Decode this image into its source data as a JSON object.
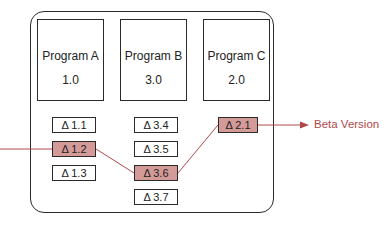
{
  "programs": [
    {
      "name": "Program A",
      "version": "1.0"
    },
    {
      "name": "Program B",
      "version": "3.0"
    },
    {
      "name": "Program C",
      "version": "2.0"
    }
  ],
  "deltas": {
    "a": [
      "Δ 1.1",
      "Δ 1.2",
      "Δ 1.3"
    ],
    "b": [
      "Δ 3.4",
      "Δ 3.5",
      "Δ 3.6",
      "Δ 3.7"
    ],
    "c": [
      "Δ 2.1"
    ]
  },
  "highlighted": [
    "Δ 1.2",
    "Δ 3.6",
    "Δ 2.1"
  ],
  "output_label": "Beta Version",
  "colors": {
    "highlight_fill": "#d49a98",
    "path_line": "#b0484a",
    "outline": "#2a2a2a"
  }
}
